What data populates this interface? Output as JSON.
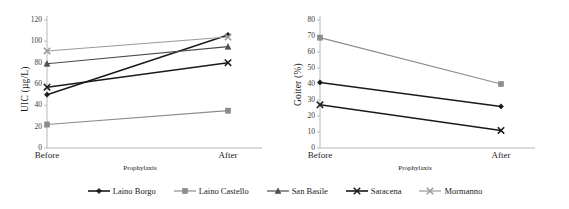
{
  "figure": {
    "background": "#ffffff"
  },
  "series_styles": {
    "laino_borgo": {
      "color": "#1a1a1a",
      "marker": "diamond"
    },
    "laino_castello": {
      "color": "#8c8c8c",
      "marker": "square"
    },
    "san_basile": {
      "color": "#4d4d4d",
      "marker": "triangle"
    },
    "saracena": {
      "color": "#1a1a1a",
      "marker": "x"
    },
    "mormanno": {
      "color": "#9a9a9a",
      "marker": "x"
    }
  },
  "legend": {
    "position": "bottom",
    "items": [
      {
        "label": "Laino Borgo",
        "marker": "diamond",
        "color": "#1a1a1a"
      },
      {
        "label": "Laino Castello",
        "marker": "square",
        "color": "#8c8c8c"
      },
      {
        "label": "San Basile",
        "marker": "triangle",
        "color": "#4d4d4d"
      },
      {
        "label": "Saracena",
        "marker": "x",
        "color": "#1a1a1a"
      },
      {
        "label": "Mormanno",
        "marker": "x",
        "color": "#9a9a9a"
      }
    ]
  },
  "chart_data": [
    {
      "id": "uic",
      "type": "line",
      "title": "",
      "xlabel": "Prophylaxis",
      "ylabel": "UIC (µg/L)",
      "categories": [
        "Before",
        "After"
      ],
      "ylim": [
        0,
        120
      ],
      "yticks": [
        0,
        20,
        40,
        60,
        80,
        100,
        120
      ],
      "grid": false,
      "series": [
        {
          "name": "Laino Borgo",
          "values": [
            50,
            106
          ]
        },
        {
          "name": "Laino Castello",
          "values": [
            22,
            35
          ]
        },
        {
          "name": "San Basile",
          "values": [
            79,
            95
          ]
        },
        {
          "name": "Saracena",
          "values": [
            57,
            80
          ]
        },
        {
          "name": "Mormanno",
          "values": [
            91,
            104
          ]
        }
      ]
    },
    {
      "id": "goiter",
      "type": "line",
      "title": "",
      "xlabel": "Prophylaxis",
      "ylabel": "Goiter (%)",
      "categories": [
        "Before",
        "After"
      ],
      "ylim": [
        0,
        80
      ],
      "yticks": [
        0,
        10,
        20,
        30,
        40,
        50,
        60,
        70,
        80
      ],
      "grid": false,
      "series": [
        {
          "name": "Laino Borgo",
          "values": [
            41,
            26
          ]
        },
        {
          "name": "Laino Castello",
          "values": [
            69,
            40
          ]
        },
        {
          "name": "Saracena",
          "values": [
            27,
            11
          ]
        }
      ]
    }
  ]
}
